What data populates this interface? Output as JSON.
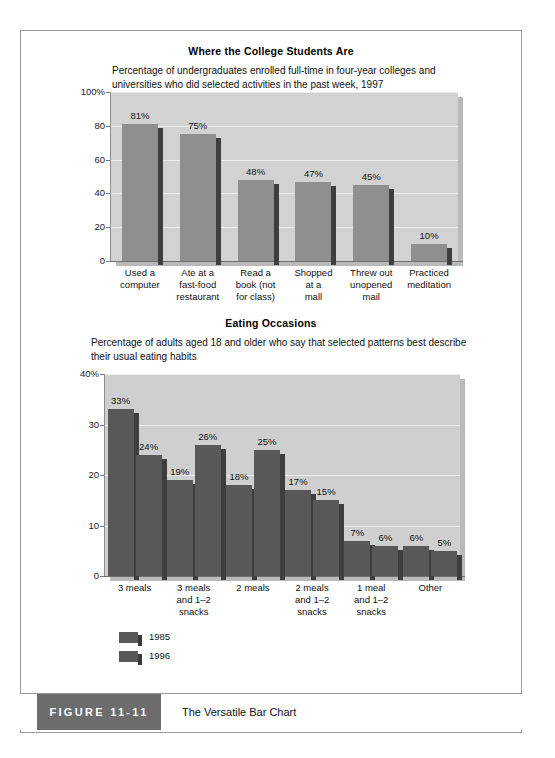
{
  "figure": {
    "tag": "FIGURE 11-11",
    "caption": "The Versatile Bar Chart"
  },
  "chart_data": [
    {
      "type": "bar",
      "title": "Where the College Students Are",
      "subtitle": "Percentage of undergraduates enrolled full-time in four-year colleges and universities who did selected activities in the past week, 1997",
      "categories": [
        "Used a computer",
        "Ate at a fast-food restaurant",
        "Read a book (not for class)",
        "Shopped at a mall",
        "Threw out unopened mail",
        "Practiced meditation"
      ],
      "category_lines": [
        [
          "Used a",
          "computer"
        ],
        [
          "Ate at a",
          "fast-food",
          "restaurant"
        ],
        [
          "Read a",
          "book (not",
          "for class)"
        ],
        [
          "Shopped",
          "at a",
          "mall"
        ],
        [
          "Threw out",
          "unopened",
          "mail"
        ],
        [
          "Practiced",
          "meditation"
        ]
      ],
      "values": [
        81,
        75,
        48,
        47,
        45,
        10
      ],
      "value_labels": [
        "81%",
        "75%",
        "48%",
        "47%",
        "45%",
        "10%"
      ],
      "ylim": [
        0,
        100
      ],
      "yticks": [
        0,
        20,
        40,
        60,
        80,
        100
      ],
      "ytick_labels": [
        "0",
        "20",
        "40",
        "60",
        "80",
        "100%"
      ],
      "xlabel": "",
      "ylabel": "",
      "grid": true,
      "legend": false,
      "bar_color": "#8f8f8f",
      "plot_bg": "#d2d2d2"
    },
    {
      "type": "bar",
      "title": "Eating Occasions",
      "subtitle": "Percentage of adults aged 18 and older who say that selected patterns best describe their usual eating habits",
      "categories": [
        "3 meals",
        "3 meals and 1-2 snacks",
        "2 meals",
        "2 meals and 1-2 snacks",
        "1 meal and 1-2 snacks",
        "Other"
      ],
      "category_lines": [
        [
          "3 meals"
        ],
        [
          "3 meals",
          "and 1–2",
          "snacks"
        ],
        [
          "2 meals"
        ],
        [
          "2 meals",
          "and 1–2",
          "snacks"
        ],
        [
          "1 meal",
          "and 1–2",
          "snacks"
        ],
        [
          "Other"
        ]
      ],
      "series": [
        {
          "name": "1985",
          "values": [
            33,
            19,
            18,
            17,
            7,
            6
          ],
          "value_labels": [
            "33%",
            "19%",
            "18%",
            "17%",
            "7%",
            "6%"
          ],
          "color": "#585858"
        },
        {
          "name": "1996",
          "values": [
            24,
            26,
            25,
            15,
            6,
            5
          ],
          "value_labels": [
            "24%",
            "26%",
            "25%",
            "15%",
            "6%",
            "5%"
          ],
          "color": "#585858"
        }
      ],
      "ylim": [
        0,
        40
      ],
      "yticks": [
        0,
        10,
        20,
        30,
        40
      ],
      "ytick_labels": [
        "0",
        "10",
        "20",
        "30",
        "40%"
      ],
      "xlabel": "",
      "ylabel": "",
      "grid": true,
      "legend": true,
      "legend_position": "bottom-left",
      "plot_bg": "#cfcfcf"
    }
  ]
}
